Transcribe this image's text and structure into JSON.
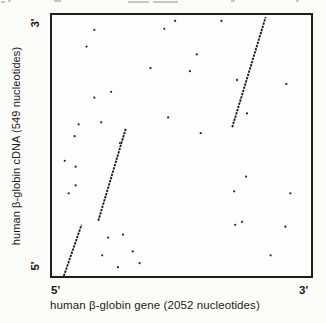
{
  "figure": {
    "y_axis": {
      "label": "human β-globin cDNA (549 nucleotides)",
      "top_end": "3'",
      "bottom_end": "5'"
    },
    "x_axis": {
      "label": "human β-globin gene (2052 nucleotides)",
      "left_end": "5'",
      "right_end": "3'"
    }
  },
  "chart_data": {
    "type": "scatter",
    "subtype": "dna-dot-matrix-alignment",
    "title": "",
    "xlabel": "human β-globin gene (2052 nucleotides)",
    "ylabel": "human β-globin cDNA (549 nucleotides)",
    "x_range_nt": [
      0,
      2052
    ],
    "y_range_nt": [
      0,
      549
    ],
    "x_orientation": "5' at left, 3' at right",
    "y_orientation": "5' at bottom, 3' at top",
    "grid": false,
    "legend": false,
    "alignment_segments_nt": [
      {
        "name": "exon-1-match",
        "gene_start": 95,
        "gene_end": 235,
        "cdna_start": 0,
        "cdna_end": 108
      },
      {
        "name": "exon-2-match",
        "gene_start": 365,
        "gene_end": 585,
        "cdna_start": 116,
        "cdna_end": 310
      },
      {
        "name": "exon-3-match",
        "gene_start": 1430,
        "gene_end": 1695,
        "cdna_start": 313,
        "cdna_end": 545
      }
    ],
    "ink_color": "#1e1e1e",
    "dot_color": "#2e2e2e",
    "background": "#fbfbf8",
    "render_px": {
      "plot_box": {
        "left": 50,
        "top": 13,
        "width": 263,
        "height": 265
      },
      "segments": [
        [
          12,
          265,
          30,
          213
        ],
        [
          47,
          209,
          75,
          115
        ],
        [
          183,
          114,
          217,
          2
        ]
      ],
      "dots": [
        [
          43,
          15
        ],
        [
          114,
          14
        ],
        [
          125,
          6
        ],
        [
          35,
          32
        ],
        [
          100,
          54
        ],
        [
          60,
          78
        ],
        [
          43,
          84
        ],
        [
          172,
          6
        ],
        [
          147,
          40
        ],
        [
          140,
          57
        ],
        [
          188,
          66
        ],
        [
          238,
          70
        ],
        [
          198,
          100
        ],
        [
          118,
          104
        ],
        [
          151,
          120
        ],
        [
          197,
          164
        ],
        [
          185,
          179
        ],
        [
          242,
          181
        ],
        [
          193,
          210
        ],
        [
          186,
          213
        ],
        [
          237,
          215
        ],
        [
          222,
          244
        ],
        [
          27,
          111
        ],
        [
          50,
          109
        ],
        [
          23,
          123
        ],
        [
          13,
          148
        ],
        [
          24,
          154
        ],
        [
          24,
          173
        ],
        [
          17,
          181
        ],
        [
          69,
          130
        ],
        [
          57,
          226
        ],
        [
          72,
          223
        ],
        [
          51,
          244
        ],
        [
          82,
          240
        ],
        [
          67,
          256
        ],
        [
          89,
          252
        ]
      ],
      "artifacts_top": [
        [
          1,
          1,
          4
        ],
        [
          8,
          0,
          3
        ],
        [
          54,
          0,
          7
        ],
        [
          128,
          1,
          21
        ],
        [
          153,
          1,
          25
        ],
        [
          231,
          0,
          4
        ],
        [
          296,
          0,
          3
        ]
      ]
    }
  }
}
